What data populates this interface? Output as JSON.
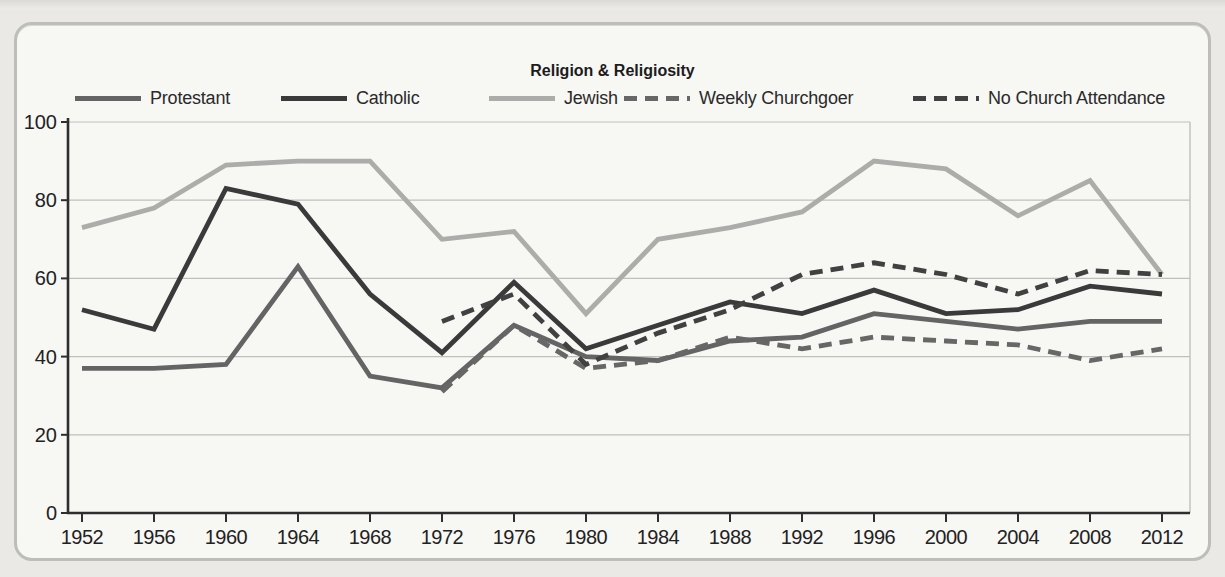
{
  "panel": {
    "title": "Religion & Religiosity"
  },
  "chart_data": {
    "type": "line",
    "title": "Religion & Religiosity",
    "x": [
      1952,
      1956,
      1960,
      1964,
      1968,
      1972,
      1976,
      1980,
      1984,
      1988,
      1992,
      1996,
      2000,
      2004,
      2008,
      2012
    ],
    "series": [
      {
        "name": "Protestant",
        "style": "solid",
        "color": "#646464",
        "values": [
          37,
          37,
          38,
          63,
          35,
          32,
          48,
          40,
          39,
          44,
          45,
          51,
          49,
          47,
          49,
          49
        ]
      },
      {
        "name": "Catholic",
        "style": "solid",
        "color": "#3a3a3a",
        "values": [
          52,
          47,
          83,
          79,
          56,
          41,
          59,
          42,
          48,
          54,
          51,
          57,
          51,
          52,
          58,
          56
        ]
      },
      {
        "name": "Jewish",
        "style": "solid",
        "color": "#acacaa",
        "values": [
          73,
          78,
          89,
          90,
          90,
          70,
          72,
          51,
          70,
          73,
          77,
          90,
          88,
          76,
          85,
          61
        ]
      },
      {
        "name": "Weekly Churchgoer",
        "style": "dashed",
        "color": "#676767",
        "values": [
          null,
          null,
          null,
          null,
          null,
          31,
          48,
          37,
          39,
          45,
          42,
          45,
          44,
          43,
          39,
          42
        ]
      },
      {
        "name": "No Church Attendance",
        "style": "dashed",
        "color": "#414141",
        "values": [
          null,
          null,
          null,
          null,
          null,
          49,
          56,
          38,
          46,
          52,
          61,
          64,
          61,
          56,
          62,
          61
        ]
      }
    ],
    "ylim": [
      0,
      100
    ],
    "yticks": [
      0,
      20,
      40,
      60,
      80,
      100
    ],
    "xtick_labels": [
      "1952",
      "1956",
      "1960",
      "1964",
      "1968",
      "1972",
      "1976",
      "1980",
      "1984",
      "1988",
      "1992",
      "1996",
      "2000",
      "2004",
      "2008",
      "2012"
    ],
    "grid": "horizontal",
    "legend_position": "top"
  },
  "legend_layout_lefts": [
    75,
    281,
    489,
    624,
    913
  ],
  "colors": {
    "panel_border": "#bdbdbb",
    "panel_background": "#f7f7f4",
    "page_background": "#eae9e5",
    "gridline": "#bfbfbd",
    "axis": "#2e2e2e",
    "tick_label": "#222222"
  }
}
